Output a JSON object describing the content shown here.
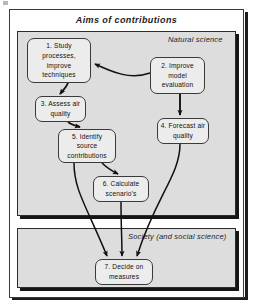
{
  "diagram": {
    "title": "Aims of contributions",
    "panels": [
      {
        "id": "natural",
        "label": "Natural science"
      },
      {
        "id": "society",
        "label": "Society (and social science)"
      }
    ],
    "nodes": [
      {
        "id": "node1",
        "number": "1.",
        "text": "1. Study processes, improve techniques"
      },
      {
        "id": "node2",
        "number": "2.",
        "text": "2. Improve model evaluation"
      },
      {
        "id": "node3",
        "number": "3.",
        "text": "3. Assess air quality"
      },
      {
        "id": "node4",
        "number": "4.",
        "text": "4. Forecast air quality"
      },
      {
        "id": "node5",
        "number": "5.",
        "text": "5. Identify source contributions"
      },
      {
        "id": "node6",
        "number": "6.",
        "text": "6. Calculate scenario's"
      },
      {
        "id": "node7",
        "number": "7.",
        "text": "7. Decide on measures"
      }
    ],
    "edges": [
      {
        "from": "node2",
        "to": "node1"
      },
      {
        "from": "node1",
        "to": "node3"
      },
      {
        "from": "node3",
        "to": "node5"
      },
      {
        "from": "node2",
        "to": "node4"
      },
      {
        "from": "node5",
        "to": "node6"
      },
      {
        "from": "node5",
        "to": "node7"
      },
      {
        "from": "node6",
        "to": "node7"
      },
      {
        "from": "node4",
        "to": "node7"
      }
    ],
    "colors": {
      "panel_fill": "#dddddd",
      "node_fill": "#ececec",
      "line": "#111111",
      "frame": "#3a3a3a"
    }
  }
}
